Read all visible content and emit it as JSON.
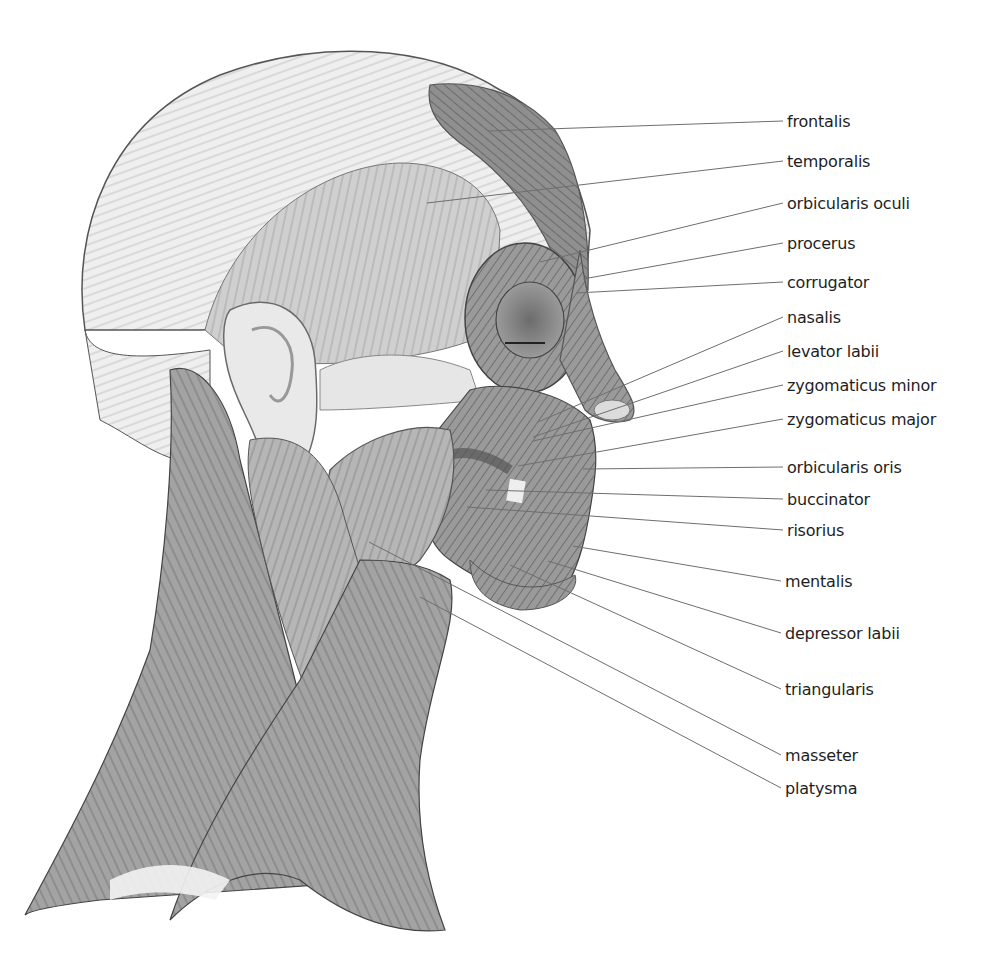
{
  "diagram": {
    "palette": {
      "background": "#ffffff",
      "scalp": "#ececec",
      "muscle_light": "#c9c9c9",
      "muscle_mid": "#9e9e9e",
      "muscle_dark": "#7d7d7d",
      "outline": "#4a4a4a",
      "leader_line": "#6e6e6e",
      "label_text": "#1e1e1e"
    },
    "labels": [
      {
        "id": "frontalis",
        "text": "frontalis",
        "x": 787,
        "y": 112,
        "anchor": [
          488,
          131
        ],
        "line_end": [
          783,
          121
        ]
      },
      {
        "id": "temporalis",
        "text": "temporalis",
        "x": 787,
        "y": 152,
        "anchor": [
          427,
          203
        ],
        "line_end": [
          783,
          161
        ]
      },
      {
        "id": "orbicularis-oculi",
        "text": "orbicularis oculi",
        "x": 787,
        "y": 194,
        "anchor": [
          540,
          262
        ],
        "line_end": [
          783,
          203
        ]
      },
      {
        "id": "procerus",
        "text": "procerus",
        "x": 787,
        "y": 234,
        "anchor": [
          583,
          279
        ],
        "line_end": [
          783,
          243
        ]
      },
      {
        "id": "corrugator",
        "text": "corrugator",
        "x": 787,
        "y": 273,
        "anchor": [
          576,
          293
        ],
        "line_end": [
          783,
          282
        ]
      },
      {
        "id": "nasalis",
        "text": "nasalis",
        "x": 787,
        "y": 308,
        "anchor": [
          538,
          422
        ],
        "line_end": [
          783,
          317
        ]
      },
      {
        "id": "levator-labii",
        "text": "levator labii",
        "x": 787,
        "y": 342,
        "anchor": [
          533,
          437
        ],
        "line_end": [
          783,
          351
        ]
      },
      {
        "id": "zygomaticus-minor",
        "text": "zygomaticus minor",
        "x": 787,
        "y": 376,
        "anchor": [
          533,
          441
        ],
        "line_end": [
          783,
          385
        ]
      },
      {
        "id": "zygomaticus-major",
        "text": "zygomaticus major",
        "x": 787,
        "y": 410,
        "anchor": [
          518,
          466
        ],
        "line_end": [
          783,
          419
        ]
      },
      {
        "id": "orbicularis-oris",
        "text": "orbicularis oris",
        "x": 787,
        "y": 458,
        "anchor": [
          583,
          469
        ],
        "line_end": [
          783,
          467
        ]
      },
      {
        "id": "buccinator",
        "text": "buccinator",
        "x": 787,
        "y": 490,
        "anchor": [
          486,
          490
        ],
        "line_end": [
          783,
          499
        ]
      },
      {
        "id": "risorius",
        "text": "risorius",
        "x": 787,
        "y": 521,
        "anchor": [
          467,
          507
        ],
        "line_end": [
          783,
          530
        ]
      },
      {
        "id": "mentalis",
        "text": "mentalis",
        "x": 785,
        "y": 572,
        "anchor": [
          573,
          546
        ],
        "line_end": [
          781,
          581
        ]
      },
      {
        "id": "depressor-labii",
        "text": "depressor labii",
        "x": 785,
        "y": 624,
        "anchor": [
          548,
          561
        ],
        "line_end": [
          781,
          633
        ]
      },
      {
        "id": "triangularis",
        "text": "triangularis",
        "x": 785,
        "y": 680,
        "anchor": [
          510,
          565
        ],
        "line_end": [
          781,
          689
        ]
      },
      {
        "id": "masseter",
        "text": "masseter",
        "x": 785,
        "y": 746,
        "anchor": [
          369,
          542
        ],
        "line_end": [
          781,
          755
        ]
      },
      {
        "id": "platysma",
        "text": "platysma",
        "x": 785,
        "y": 779,
        "anchor": [
          420,
          597
        ],
        "line_end": [
          781,
          788
        ]
      }
    ]
  }
}
